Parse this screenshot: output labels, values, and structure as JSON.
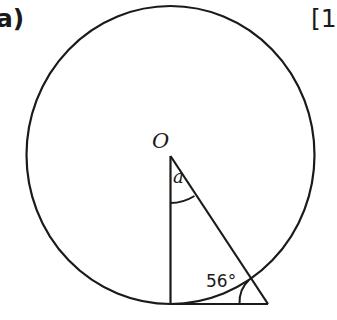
{
  "question": {
    "part_label": "a)",
    "marks_label": "[1"
  },
  "diagram": {
    "center_label": "O",
    "unknown_angle_label": "a",
    "given_angle_label": "56°",
    "given_angle_degrees": 56
  },
  "colors": {
    "stroke": "#1a1a1a",
    "background": "#ffffff"
  }
}
